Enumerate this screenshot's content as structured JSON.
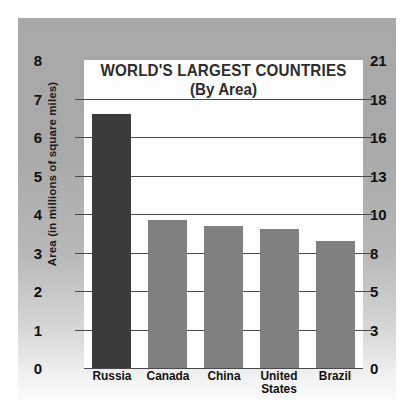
{
  "chart_data": {
    "type": "bar",
    "title": "WORLD'S LARGEST COUNTRIES",
    "subtitle": "(By Area)",
    "categories": [
      "Russia",
      "Canada",
      "China",
      "United States",
      "Brazil"
    ],
    "values": [
      6.6,
      3.85,
      3.7,
      3.6,
      3.3
    ],
    "xlabel": "",
    "ylabel": "Area (in millions of square miles)",
    "ylabel_right": "Area (in millions of square kilometers)",
    "ylim": [
      0,
      8
    ],
    "ylim_right": [
      0,
      21
    ],
    "yticks": [
      0,
      1,
      2,
      3,
      4,
      5,
      6,
      7,
      8
    ],
    "yticks_right": [
      0,
      3,
      5,
      8,
      10,
      13,
      16,
      18,
      21
    ],
    "grid": true,
    "legend": "none",
    "bar_colors": [
      "#3b3b3b",
      "#808080",
      "#808080",
      "#808080",
      "#808080"
    ],
    "units": "millions of square miles"
  },
  "axes": {
    "left": {
      "title": "Area (in millions of square miles)",
      "ticks": [
        {
          "label": "8",
          "value": 8
        },
        {
          "label": "7",
          "value": 7
        },
        {
          "label": "6",
          "value": 6
        },
        {
          "label": "5",
          "value": 5
        },
        {
          "label": "4",
          "value": 4
        },
        {
          "label": "3",
          "value": 3
        },
        {
          "label": "2",
          "value": 2
        },
        {
          "label": "1",
          "value": 1
        },
        {
          "label": "0",
          "value": 0
        }
      ]
    },
    "right": {
      "title": "Area (in millions of square kilometers)",
      "ticks": [
        {
          "label": "21",
          "value": 8
        },
        {
          "label": "18",
          "value": 7
        },
        {
          "label": "16",
          "value": 6
        },
        {
          "label": "13",
          "value": 5
        },
        {
          "label": "10",
          "value": 4
        },
        {
          "label": "8",
          "value": 3
        },
        {
          "label": "5",
          "value": 2
        },
        {
          "label": "3",
          "value": 1
        },
        {
          "label": "0",
          "value": 0
        }
      ]
    }
  },
  "bars": [
    {
      "label": "Russia",
      "label_lines": [
        "Russia"
      ],
      "value": 6.6,
      "color": "#3b3b3b"
    },
    {
      "label": "Canada",
      "label_lines": [
        "Canada"
      ],
      "value": 3.85,
      "color": "#808080"
    },
    {
      "label": "China",
      "label_lines": [
        "China"
      ],
      "value": 3.7,
      "color": "#808080"
    },
    {
      "label": "United States",
      "label_lines": [
        "United",
        "States"
      ],
      "value": 3.6,
      "color": "#808080"
    },
    {
      "label": "Brazil",
      "label_lines": [
        "Brazil"
      ],
      "value": 3.3,
      "color": "#808080"
    }
  ],
  "colors": {
    "panel_top": "#a8a8a8",
    "panel_bottom": "#fbfbfb",
    "plot_background": "#fdfdfd",
    "gridline": "#4a4a4a",
    "text": "#111111",
    "title_text": "#2d2d2d",
    "bar_highlight": "#3b3b3b",
    "bar_default": "#808080"
  }
}
